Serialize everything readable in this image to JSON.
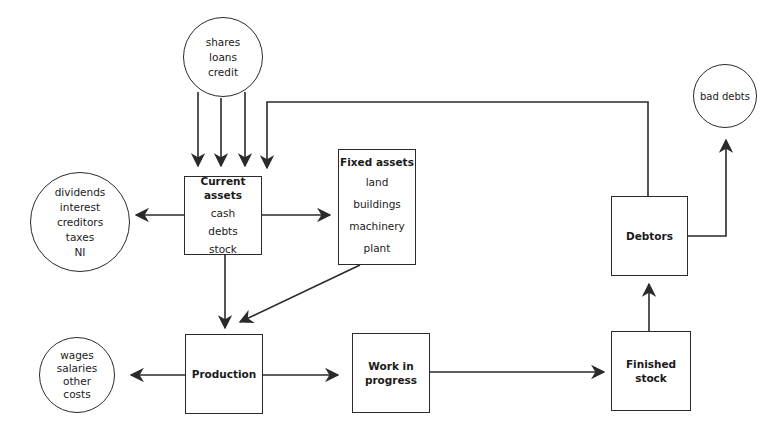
{
  "diagram": {
    "type": "working-capital-flow",
    "nodes": {
      "sources": {
        "shape": "circle",
        "items": [
          "shares",
          "loans",
          "credit"
        ]
      },
      "current_assets": {
        "shape": "box",
        "title": "Current assets",
        "items": [
          "cash",
          "debts",
          "stock"
        ]
      },
      "outflows": {
        "shape": "circle",
        "items": [
          "dividends",
          "interest",
          "creditors",
          "taxes",
          "NI"
        ]
      },
      "fixed_assets": {
        "shape": "box",
        "title": "Fixed assets",
        "items": [
          "land",
          "buildings",
          "machinery",
          "plant"
        ]
      },
      "production": {
        "shape": "box",
        "title": "Production"
      },
      "costs": {
        "shape": "circle",
        "items": [
          "wages",
          "salaries",
          "other",
          "costs"
        ]
      },
      "wip": {
        "shape": "box",
        "title_lines": [
          "Work in",
          "progress"
        ]
      },
      "finished_stock": {
        "shape": "box",
        "title": "Finished stock"
      },
      "debtors": {
        "shape": "box",
        "title": "Debtors"
      },
      "bad_debts": {
        "shape": "circle",
        "items": [
          "bad debts"
        ]
      }
    },
    "edges": [
      {
        "from": "sources",
        "to": "current_assets",
        "count": 3
      },
      {
        "from": "debtors",
        "to": "current_assets"
      },
      {
        "from": "current_assets",
        "to": "outflows"
      },
      {
        "from": "current_assets",
        "to": "fixed_assets"
      },
      {
        "from": "current_assets",
        "to": "production"
      },
      {
        "from": "fixed_assets",
        "to": "production"
      },
      {
        "from": "production",
        "to": "costs"
      },
      {
        "from": "production",
        "to": "wip"
      },
      {
        "from": "wip",
        "to": "finished_stock"
      },
      {
        "from": "finished_stock",
        "to": "debtors"
      },
      {
        "from": "debtors",
        "to": "bad_debts"
      }
    ],
    "colors": {
      "line": "#2a2a2a",
      "background": "#ffffff"
    }
  }
}
